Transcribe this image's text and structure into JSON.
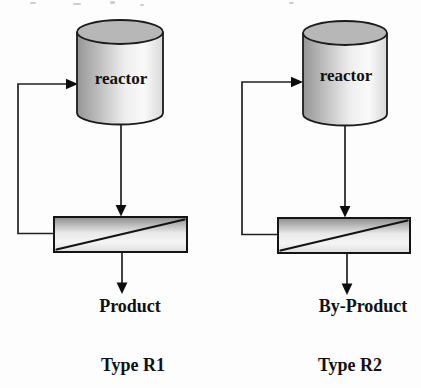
{
  "figure": {
    "background": "#fdfdfd"
  },
  "colors": {
    "outline": "#1b1b1b",
    "flow_line": "#222222",
    "arrow": "#0d0d0d",
    "cylinder_top": "#b7b7b7",
    "cylinder_body_dark": "#969696",
    "cylinder_body_light": "#fafafa",
    "cylinder_body_edge": "#d8d8d8",
    "separator_dark": "#8d8d8d",
    "separator_light": "#f5f5f5",
    "separator_bottom": "#dedede",
    "text": "#111111"
  },
  "diagrams": [
    {
      "reactor_label": "reactor",
      "output_label": "Product",
      "type_label": "Type R1"
    },
    {
      "reactor_label": "reactor",
      "output_label": "By-Product",
      "type_label": "Type R2"
    }
  ]
}
